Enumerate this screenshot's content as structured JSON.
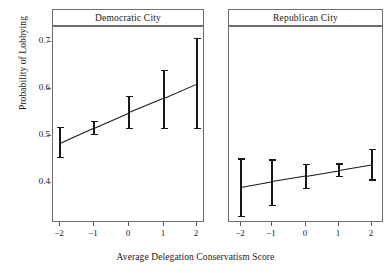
{
  "chart_data": {
    "type": "line",
    "title": "",
    "xlabel": "Average Delegation Conservatism Score",
    "ylabel": "Probability of Lobbying",
    "x": [
      -2,
      -1,
      0,
      1,
      2
    ],
    "xlim": [
      -2.6,
      2.6
    ],
    "ylim": [
      0.333,
      0.715
    ],
    "yticks": [
      0.4,
      0.5,
      0.6,
      0.7
    ],
    "ytick_labels": [
      "0.4",
      "0.5",
      "0.6",
      "0.7"
    ],
    "xtick_labels": [
      "−2",
      "−1",
      "0",
      "1",
      "2"
    ],
    "grid": false,
    "legend": "none",
    "panel_layout": "1x2 facet",
    "panels": [
      {
        "label": "Democratic City",
        "series": [
          {
            "name": "Predicted probability of lobbying",
            "values": [
              0.489,
              0.519,
              0.549,
              0.577,
              0.605
            ],
            "ci_lower": [
              0.462,
              0.507,
              0.518,
              0.518,
              0.518
            ],
            "ci_upper": [
              0.521,
              0.532,
              0.58,
              0.632,
              0.694
            ]
          }
        ]
      },
      {
        "label": "Republican City",
        "series": [
          {
            "name": "Predicted probability of lobbying",
            "values": [
              0.403,
              0.414,
              0.425,
              0.436,
              0.447
            ],
            "ci_lower": [
              0.347,
              0.368,
              0.402,
              0.424,
              0.418
            ],
            "ci_upper": [
              0.459,
              0.457,
              0.448,
              0.449,
              0.477
            ]
          }
        ]
      }
    ]
  },
  "axis": {
    "y_title": "Probability of Lobbying",
    "x_title": "Average Delegation Conservatism Score",
    "yticks": [
      "0.7",
      "0.6",
      "0.5",
      "0.4"
    ],
    "xticks": [
      "−2",
      "−1",
      "0",
      "1",
      "2"
    ]
  },
  "panel_titles": {
    "left": "Democratic City",
    "right": "Republican City"
  },
  "colors": {
    "line": "#181818",
    "frame": "#6e6e6e",
    "text": "#1a1a1a",
    "background": "#ffffff"
  }
}
